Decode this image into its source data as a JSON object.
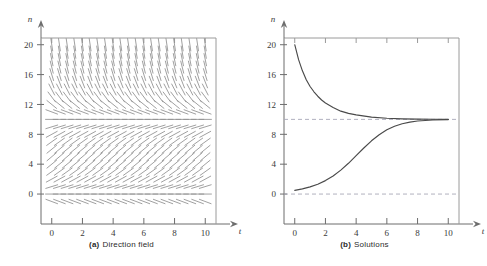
{
  "figure": {
    "panels": [
      {
        "id": "direction-field",
        "caption_tag": "(a)",
        "caption_text": "Direction field",
        "axis_x_name": "t",
        "axis_y_name": "n"
      },
      {
        "id": "solutions",
        "caption_tag": "(b)",
        "caption_text": "Solutions",
        "axis_x_name": "t",
        "axis_y_name": "n"
      }
    ]
  },
  "colors": {
    "background": "#ffffff",
    "axis": "#6d6d6d",
    "frame": "#9a9a9a",
    "curve": "#4a4a4a",
    "slope_mark": "#8f8f8f",
    "asymptote": "#a8a8b8",
    "text": "#3a3a3a"
  },
  "chart_data": [
    {
      "type": "scatter",
      "id": "direction-field",
      "title": "(a) Direction field",
      "xlabel": "t",
      "ylabel": "n",
      "xlim": [
        -0.7,
        10.7
      ],
      "ylim": [
        -1.6,
        20.9
      ],
      "grid": false,
      "legend": "none",
      "xticks": [
        0,
        2,
        4,
        6,
        8,
        10
      ],
      "xtick_labels": [
        "0",
        "2",
        "4",
        "6",
        "8",
        "10"
      ],
      "yticks": [
        0,
        4,
        8,
        12,
        16,
        20
      ],
      "ytick_labels": [
        "0",
        "4",
        "8",
        "12",
        "16",
        "20"
      ],
      "equation": "dn/dt = 0.7 n (1 - n/10)",
      "equilibria": [
        0,
        10
      ],
      "slope_grid": {
        "t_start": 0.0,
        "t_step": 0.5,
        "t_count": 21,
        "n_start": -1.0,
        "n_step": 1.0,
        "n_count": 22
      },
      "annotations": [
        "Slope marks are horizontal along n = 0 and n = 10",
        "Slopes point downward above n = 10",
        "Slopes point upward between n = 0 and n = 10"
      ]
    },
    {
      "type": "line",
      "id": "solutions",
      "title": "(b) Solutions",
      "xlabel": "t",
      "ylabel": "n",
      "xlim": [
        -0.7,
        10.7
      ],
      "ylim": [
        -1.6,
        20.9
      ],
      "grid": false,
      "legend": "none",
      "xticks": [
        0,
        2,
        4,
        6,
        8,
        10
      ],
      "xtick_labels": [
        "0",
        "2",
        "4",
        "6",
        "8",
        "10"
      ],
      "yticks": [
        0,
        4,
        8,
        12,
        16,
        20
      ],
      "ytick_labels": [
        "0",
        "4",
        "8",
        "12",
        "16",
        "20"
      ],
      "asymptotes": [
        {
          "value": 10,
          "style": "dashed"
        },
        {
          "value": 0,
          "style": "dashed"
        }
      ],
      "series": [
        {
          "name": "Upper solution (n0 = 20)",
          "x": [
            0,
            0.25,
            0.5,
            0.75,
            1,
            1.25,
            1.5,
            1.75,
            2,
            2.5,
            3,
            3.5,
            4,
            5,
            6,
            7,
            8,
            9,
            10
          ],
          "values": [
            20.0,
            18.0,
            16.5,
            15.3,
            14.4,
            13.7,
            13.1,
            12.6,
            12.2,
            11.6,
            11.1,
            10.8,
            10.6,
            10.3,
            10.15,
            10.07,
            10.03,
            10.02,
            10.0
          ]
        },
        {
          "name": "Lower solution (n0 = 0.5)",
          "x": [
            0,
            0.5,
            1,
            1.5,
            2,
            2.5,
            3,
            3.5,
            4,
            4.5,
            5,
            5.5,
            6,
            6.5,
            7,
            7.5,
            8,
            9,
            10
          ],
          "values": [
            0.5,
            0.69,
            0.96,
            1.32,
            1.8,
            2.42,
            3.2,
            4.12,
            5.14,
            6.17,
            7.13,
            7.95,
            8.6,
            9.08,
            9.42,
            9.64,
            9.78,
            9.92,
            9.97
          ]
        }
      ]
    }
  ]
}
